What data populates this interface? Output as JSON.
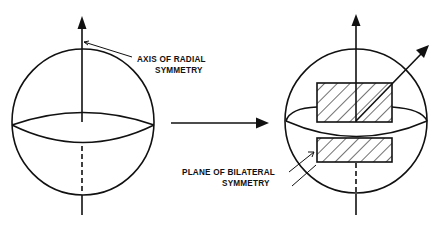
{
  "diagram": {
    "type": "symmetry-transition",
    "left_panel": {
      "label_line1": "AXIS OF RADIAL",
      "label_line2": "SYMMETRY"
    },
    "right_panel": {
      "label_line1": "PLANE OF BILATERAL",
      "label_line2": "SYMMETRY"
    },
    "colors": {
      "ink": "#111111",
      "background": "#ffffff"
    }
  }
}
